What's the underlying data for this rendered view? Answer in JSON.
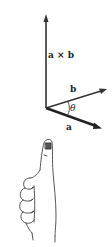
{
  "diagram": {
    "labels": {
      "cross_product": "a × b",
      "vector_b": "b",
      "vector_a": "a",
      "angle": "θ"
    },
    "vectors": [
      {
        "name": "a × b",
        "from": [
          46,
          108
        ],
        "to": [
          46,
          15
        ]
      },
      {
        "name": "b",
        "from": [
          46,
          108
        ],
        "to": [
          107,
          89
        ]
      },
      {
        "name": "a",
        "from": [
          46,
          108
        ],
        "to": [
          101,
          128
        ]
      }
    ],
    "colors": {
      "stroke": "#222222",
      "background": "#ffffff"
    }
  }
}
